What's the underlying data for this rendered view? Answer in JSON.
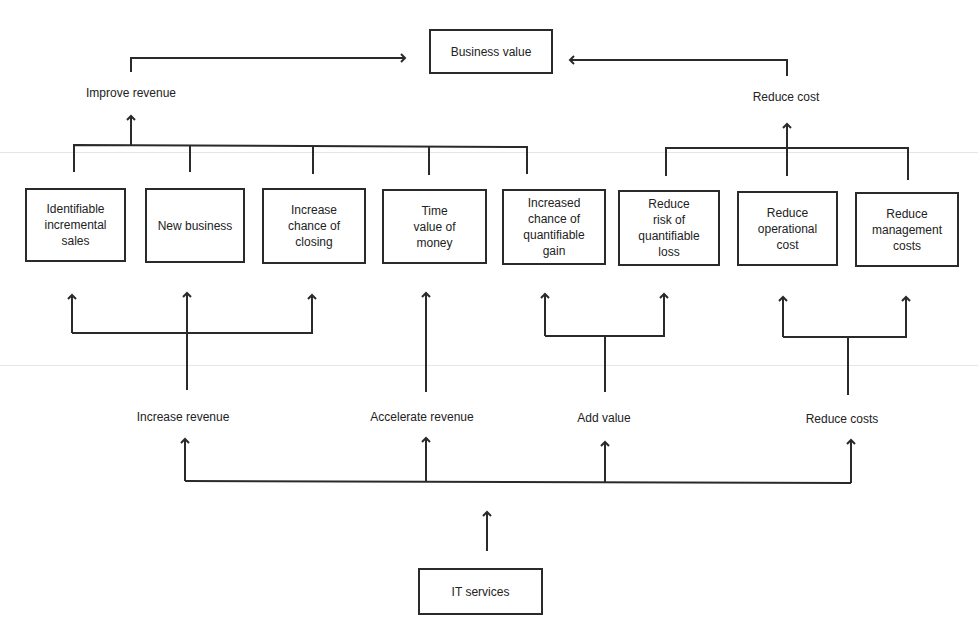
{
  "diagram": {
    "top": {
      "label": "Business value"
    },
    "bottom": {
      "label": "IT services"
    },
    "upper_labels": {
      "improve": "Improve revenue",
      "reduce": "Reduce cost"
    },
    "boxes": [
      {
        "label": "Identifiable\nincremental\nsales"
      },
      {
        "label": "New business"
      },
      {
        "label": "Increase\nchance of\nclosing"
      },
      {
        "label": "Time\nvalue of\nmoney"
      },
      {
        "label": "Increased\nchance of\nquantifiable\ngain"
      },
      {
        "label": "Reduce\nrisk of\nquantifiable\nloss"
      },
      {
        "label": "Reduce\noperational\ncost"
      },
      {
        "label": "Reduce\nmanagement\ncosts"
      }
    ],
    "lower_labels": {
      "increase": "Increase revenue",
      "accelerate": "Accelerate revenue",
      "add": "Add value",
      "reduce": "Reduce costs"
    },
    "colors": {
      "line": "#2a2a2a",
      "background": "#ffffff"
    }
  }
}
